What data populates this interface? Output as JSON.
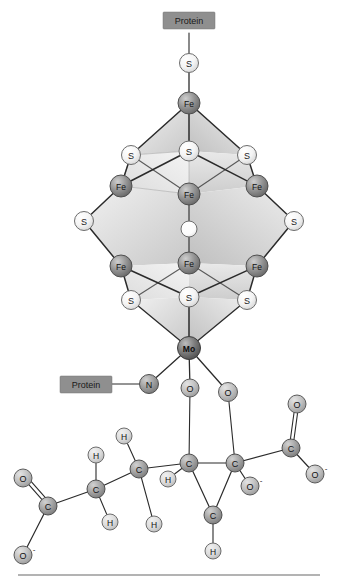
{
  "figure": {
    "width": 339,
    "height": 583,
    "background": "#ffffff"
  },
  "colors": {
    "fe": "#8c8c8c",
    "mo": "#6e6e6e",
    "s": "#f2f2f2",
    "o": "#bdbdbd",
    "c": "#9e9e9e",
    "h": "#d8d8d8",
    "n": "#9a9a9a",
    "interstitial": "#fbfbfb",
    "bond": "#2b2b2b",
    "face_light": "#e8e8e8",
    "face_mid": "#d5d5d5",
    "face_dark": "#bfbfbf",
    "protein_box": "#8f8f8f",
    "rule": "#9a9a9a"
  },
  "labels": {
    "protein_top": "Protein",
    "protein_bottom": "Protein",
    "fe": "Fe",
    "mo": "Mo",
    "s": "S",
    "o": "O",
    "c": "C",
    "h": "H",
    "n": "N",
    "o_minus": "O",
    "charge_minus": "-",
    "interstitial": ""
  },
  "cluster": {
    "name": "FeMo-cofactor",
    "atoms": [
      {
        "id": "S-cys",
        "element": "S",
        "x": 189,
        "y": 63,
        "r": 9.5
      },
      {
        "id": "Fe1",
        "element": "Fe",
        "x": 189,
        "y": 103,
        "r": 11
      },
      {
        "id": "S-tl",
        "element": "S",
        "x": 131,
        "y": 155,
        "r": 9.5
      },
      {
        "id": "S-tm",
        "element": "S",
        "x": 189,
        "y": 151,
        "r": 10
      },
      {
        "id": "S-tr",
        "element": "S",
        "x": 247,
        "y": 155,
        "r": 9.5
      },
      {
        "id": "Fe2",
        "element": "Fe",
        "x": 121,
        "y": 186,
        "r": 11
      },
      {
        "id": "Fe3",
        "element": "Fe",
        "x": 189,
        "y": 194,
        "r": 11
      },
      {
        "id": "Fe4",
        "element": "Fe",
        "x": 257,
        "y": 186,
        "r": 11
      },
      {
        "id": "S-ml",
        "element": "S",
        "x": 84,
        "y": 221,
        "r": 9.5
      },
      {
        "id": "X-int",
        "element": "X",
        "x": 189,
        "y": 229,
        "r": 8
      },
      {
        "id": "S-mr",
        "element": "S",
        "x": 294,
        "y": 221,
        "r": 9.5
      },
      {
        "id": "Fe5",
        "element": "Fe",
        "x": 121,
        "y": 266,
        "r": 11
      },
      {
        "id": "Fe6",
        "element": "Fe",
        "x": 189,
        "y": 263,
        "r": 11
      },
      {
        "id": "Fe7",
        "element": "Fe",
        "x": 257,
        "y": 266,
        "r": 11
      },
      {
        "id": "S-bl",
        "element": "S",
        "x": 131,
        "y": 300,
        "r": 9.5
      },
      {
        "id": "S-bm",
        "element": "S",
        "x": 189,
        "y": 297,
        "r": 10
      },
      {
        "id": "S-br",
        "element": "S",
        "x": 247,
        "y": 300,
        "r": 9.5
      },
      {
        "id": "Mo",
        "element": "Mo",
        "x": 189,
        "y": 348,
        "r": 11.5
      }
    ]
  },
  "ligands": {
    "histidine": {
      "element": "N",
      "x": 149,
      "y": 384,
      "r": 9.5
    },
    "homocitrate_o1": {
      "element": "O",
      "x": 190,
      "y": 388,
      "r": 9
    },
    "homocitrate_o2": {
      "element": "O",
      "x": 228,
      "y": 392,
      "r": 9.5
    }
  },
  "homocitrate": {
    "atoms": [
      {
        "id": "C-alkoxide",
        "element": "C",
        "x": 189,
        "y": 463,
        "r": 9
      },
      {
        "id": "C-quart",
        "element": "C",
        "x": 235,
        "y": 463,
        "r": 9
      },
      {
        "id": "C-carboxR",
        "element": "C",
        "x": 291,
        "y": 448,
        "r": 9
      },
      {
        "id": "O-R-dbl",
        "element": "O",
        "x": 297,
        "y": 404,
        "r": 9
      },
      {
        "id": "O-R-minus",
        "element": "O",
        "x": 315,
        "y": 474,
        "r": 9
      },
      {
        "id": "O-mid-minus",
        "element": "O",
        "x": 250,
        "y": 486,
        "r": 9
      },
      {
        "id": "C-ch2a",
        "element": "C",
        "x": 139,
        "y": 469,
        "r": 9
      },
      {
        "id": "C-ch2b",
        "element": "C",
        "x": 96,
        "y": 489,
        "r": 9
      },
      {
        "id": "C-carboxL",
        "element": "C",
        "x": 48,
        "y": 506,
        "r": 9
      },
      {
        "id": "O-L-dbl",
        "element": "O",
        "x": 23,
        "y": 478,
        "r": 9
      },
      {
        "id": "O-L-minus",
        "element": "O",
        "x": 23,
        "y": 555,
        "r": 9
      },
      {
        "id": "H-a1",
        "element": "H",
        "x": 168,
        "y": 479,
        "r": 8
      },
      {
        "id": "H-a2",
        "element": "H",
        "x": 213,
        "y": 515,
        "r": 8
      },
      {
        "id": "H-b1",
        "element": "H",
        "x": 124,
        "y": 436,
        "r": 8
      },
      {
        "id": "H-b2",
        "element": "H",
        "x": 154,
        "y": 524,
        "r": 8
      },
      {
        "id": "H-c1",
        "element": "H",
        "x": 96,
        "y": 455,
        "r": 8
      },
      {
        "id": "H-c2",
        "element": "H",
        "x": 110,
        "y": 522,
        "r": 8
      }
    ]
  },
  "bottom_rule": {
    "visible": true,
    "y": 575
  }
}
